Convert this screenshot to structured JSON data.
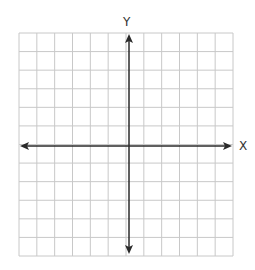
{
  "diagram": {
    "type": "coordinate-plane",
    "grid": {
      "columns": 12,
      "rows": 12,
      "line_color": "#c8c8c8"
    },
    "axis_color": "#2a2a2a",
    "x_axis_label": "X",
    "y_axis_label": "Y"
  }
}
